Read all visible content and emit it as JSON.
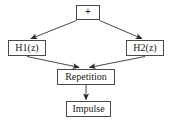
{
  "diagram": {
    "background_color": "#ffffff",
    "border_color": "#4a4a4a",
    "edge_color": "#333333",
    "text_color": "#1a1a1a",
    "nodes": [
      {
        "id": "sum",
        "label": "+",
        "shape": "rect"
      },
      {
        "id": "h1",
        "label": "H1(z)",
        "shape": "rect"
      },
      {
        "id": "h2",
        "label": "H2(z)",
        "shape": "rect"
      },
      {
        "id": "repetition",
        "label": "Repetition",
        "shape": "rect"
      },
      {
        "id": "impulse",
        "label": "Impulse",
        "shape": "rect"
      }
    ],
    "edges": [
      {
        "id": "sum-to-h1",
        "from": "sum",
        "to": "h1",
        "arrowhead": "filled"
      },
      {
        "id": "sum-to-h2",
        "from": "sum",
        "to": "h2",
        "arrowhead": "filled"
      },
      {
        "id": "h1-to-repetition",
        "from": "h1",
        "to": "repetition",
        "arrowhead": "filled"
      },
      {
        "id": "h2-to-repetition",
        "from": "h2",
        "to": "repetition",
        "arrowhead": "filled"
      },
      {
        "id": "repetition-to-impulse",
        "from": "repetition",
        "to": "impulse",
        "arrowhead": "filled"
      }
    ]
  }
}
